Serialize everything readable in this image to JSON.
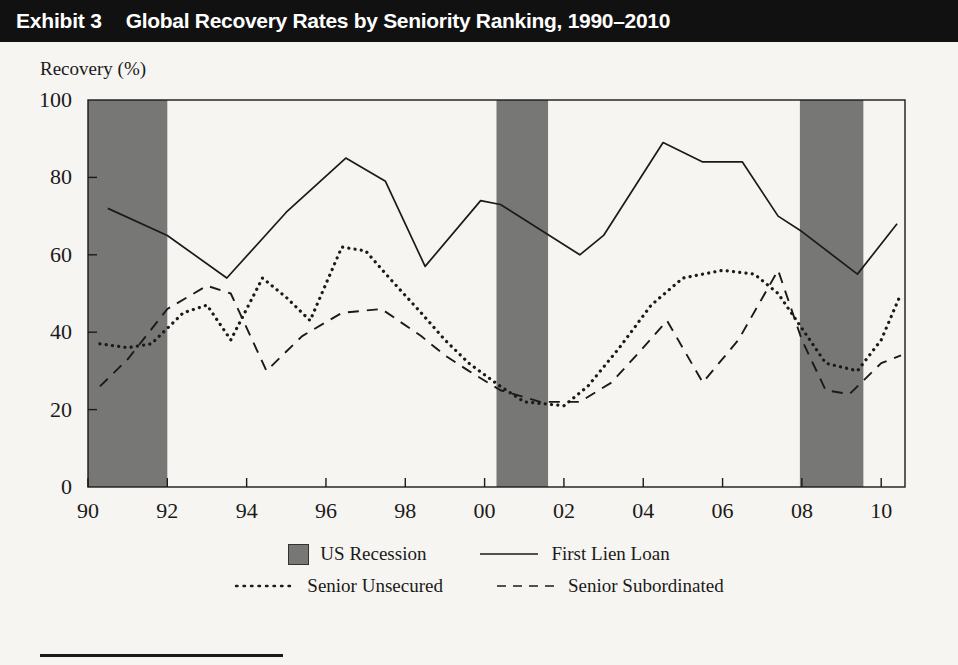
{
  "header": {
    "exhibit_label": "Exhibit 3",
    "title": "Global Recovery Rates by Seniority Ranking, 1990–2010"
  },
  "axis": {
    "ylabel": "Recovery (%)",
    "yticks": [
      "0",
      "20",
      "40",
      "60",
      "80",
      "100"
    ],
    "xticks": [
      "90",
      "92",
      "94",
      "96",
      "98",
      "00",
      "02",
      "04",
      "06",
      "08",
      "10"
    ]
  },
  "legend": {
    "recession": "US Recession",
    "first_lien": "First Lien Loan",
    "senior_unsecured": "Senior Unsecured",
    "senior_subordinated": "Senior Subordinated"
  },
  "colors": {
    "title_bar": "#111111",
    "page_bg": "#f6f5f1",
    "recession_band": "#777776",
    "line": "#1a1a1a"
  },
  "chart_data": {
    "type": "line",
    "title": "Global Recovery Rates by Seniority Ranking, 1990–2010",
    "xlabel": "",
    "ylabel": "Recovery (%)",
    "xlim": [
      1990,
      2010.6
    ],
    "ylim": [
      0,
      100
    ],
    "grid": false,
    "legend_position": "bottom",
    "xtick_values": [
      1990,
      1992,
      1994,
      1996,
      1998,
      2000,
      2002,
      2004,
      2006,
      2008,
      2010
    ],
    "xtick_labels": [
      "90",
      "92",
      "94",
      "96",
      "98",
      "00",
      "02",
      "04",
      "06",
      "08",
      "10"
    ],
    "ytick_values": [
      0,
      20,
      40,
      60,
      80,
      100
    ],
    "shaded_regions": [
      {
        "label": "US Recession",
        "x0": 1990.0,
        "x1": 1992.0
      },
      {
        "label": "US Recession",
        "x0": 2000.3,
        "x1": 2001.6
      },
      {
        "label": "US Recession",
        "x0": 2007.95,
        "x1": 2009.55
      }
    ],
    "series": [
      {
        "name": "First Lien Loan",
        "style": "solid",
        "x": [
          1990.5,
          1992.0,
          1993.5,
          1995.0,
          1996.5,
          1997.5,
          1998.5,
          1999.9,
          2000.4,
          2002.4,
          2003.0,
          2004.5,
          2005.5,
          2006.5,
          2007.4,
          2008.0,
          2009.4,
          2010.4
        ],
        "values": [
          72,
          65,
          54,
          71,
          85,
          79,
          57,
          74,
          73,
          60,
          65,
          89,
          84,
          84,
          70,
          66,
          55,
          68
        ]
      },
      {
        "name": "Senior Unsecured",
        "style": "dotted",
        "x": [
          1990.3,
          1991.0,
          1991.6,
          1992.4,
          1993.0,
          1993.6,
          1994.4,
          1995.0,
          1995.6,
          1996.4,
          1997.0,
          1997.6,
          1998.4,
          1999.0,
          1999.6,
          2000.4,
          2001.0,
          2002.0,
          2002.6,
          2003.4,
          2004.2,
          2005.0,
          2006.0,
          2006.8,
          2007.4,
          2008.0,
          2008.6,
          2009.4,
          2010.0,
          2010.5
        ],
        "values": [
          37,
          36,
          37,
          45,
          47,
          38,
          54,
          49,
          43,
          62,
          61,
          54,
          45,
          38,
          32,
          26,
          22,
          21,
          26,
          36,
          47,
          54,
          56,
          55,
          50,
          41,
          32,
          30,
          38,
          50
        ]
      },
      {
        "name": "Senior Subordinated",
        "style": "dashed",
        "x": [
          1990.3,
          1991.0,
          1992.0,
          1993.0,
          1993.6,
          1994.5,
          1995.4,
          1996.4,
          1997.4,
          1998.4,
          1999.0,
          1999.6,
          2000.4,
          2001.4,
          2002.4,
          2003.2,
          2004.0,
          2004.6,
          2005.5,
          2006.4,
          2007.4,
          2008.0,
          2008.6,
          2009.2,
          2010.0,
          2010.5
        ],
        "values": [
          26,
          33,
          46,
          52,
          50,
          30,
          39,
          45,
          46,
          39,
          34,
          30,
          25,
          22,
          22,
          27,
          36,
          43,
          27,
          38,
          56,
          38,
          25,
          24,
          32,
          34
        ]
      }
    ]
  }
}
